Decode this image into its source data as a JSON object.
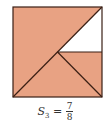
{
  "figure": {
    "square": {
      "x": 13,
      "y": 7,
      "size": 89
    },
    "fill_color": "#e8a283",
    "line_color": "#3a1f14",
    "unfilled_color": "#ffffff",
    "shaded_fraction": "7/8"
  },
  "label": {
    "variable": "S",
    "subscript": "3",
    "equals": "=",
    "numerator": "7",
    "denominator": "8"
  }
}
